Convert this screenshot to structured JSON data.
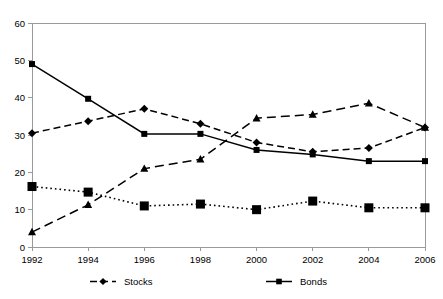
{
  "chart": {
    "title": "",
    "xlabel": "",
    "ylabel": ""
  },
  "axis": {
    "y_ticks": [
      "0",
      "10",
      "20",
      "30",
      "40",
      "50",
      "60"
    ],
    "x_ticks": [
      "1992",
      "1994",
      "1996",
      "1998",
      "2000",
      "2002",
      "2004",
      "2006"
    ]
  },
  "legend": {
    "items": [
      {
        "label": "Stocks",
        "style": "dashed-diamond"
      },
      {
        "label": "Bonds",
        "style": "solid-square"
      }
    ]
  },
  "chart_data": {
    "type": "line",
    "title": "",
    "xlabel": "",
    "ylabel": "",
    "x": [
      1992,
      1994,
      1996,
      1998,
      2000,
      2002,
      2004,
      2006
    ],
    "categories": [
      "1992",
      "1994",
      "1996",
      "1998",
      "2000",
      "2002",
      "2004",
      "2006"
    ],
    "ylim": [
      0,
      60
    ],
    "ytick_step": 10,
    "grid": false,
    "legend_position": "bottom",
    "series": [
      {
        "name": "Stocks",
        "marker": "diamond",
        "linestyle": "dashed",
        "color": "#000000",
        "values": [
          30.5,
          33.7,
          37.0,
          33.0,
          28.0,
          25.5,
          26.5,
          32.0
        ]
      },
      {
        "name": "Bonds",
        "marker": "square",
        "linestyle": "solid",
        "color": "#000000",
        "values": [
          49.0,
          39.7,
          30.3,
          30.3,
          26.0,
          24.8,
          23.0,
          23.0
        ]
      },
      {
        "name": "",
        "marker": "triangle",
        "linestyle": "long-dashed",
        "color": "#000000",
        "values": [
          4.0,
          11.3,
          21.0,
          23.5,
          34.5,
          35.5,
          38.5,
          32.0
        ]
      },
      {
        "name": "",
        "marker": "large-square",
        "linestyle": "dotted",
        "color": "#000000",
        "values": [
          16.2,
          14.7,
          11.0,
          11.5,
          10.0,
          12.3,
          10.5,
          10.5
        ]
      }
    ]
  }
}
